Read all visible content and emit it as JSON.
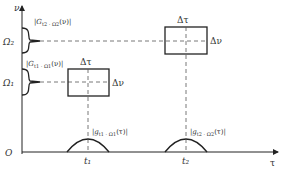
{
  "axes": {
    "y_label": "ν",
    "x_label": "τ",
    "origin_label": "O"
  },
  "levels": {
    "omega1": "Ω₁",
    "omega2": "Ω₂"
  },
  "times": {
    "t1": "t₁",
    "t2": "t₂"
  },
  "spectra": {
    "s1": "|G_{t1·Ω1}(ν)|",
    "s2": "|G_{t2·Ω2}(ν)|",
    "s1_text": "|Gt1 · Ω1 (ν)|",
    "s2_text": "|Gt2 · Ω2 (ν)|"
  },
  "envelopes": {
    "e1_text": "|gt1 · Ω1 (τ)|",
    "e2_text": "|gΩ2 · Ω2 (τ)|"
  },
  "boxes": {
    "box1": {
      "dtau": "Δτ",
      "dnu": "Δν"
    },
    "box2": {
      "dtau": "Δτ",
      "dnu": "Δν"
    }
  },
  "colors": {
    "line": "#222222",
    "dash": "#555555",
    "text": "#333333"
  }
}
